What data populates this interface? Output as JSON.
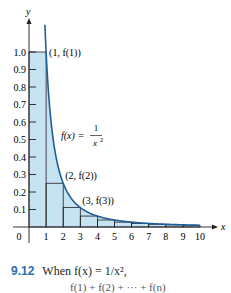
{
  "figure": {
    "caption_number": "9.12",
    "caption_text": "When f(x) = 1/x²,",
    "partial_next_line": "f(1) + f(2) + ··· + f(n)"
  },
  "colors": {
    "fill": "#c6e3f2",
    "curve": "#1f5f99",
    "axis": "#231f20",
    "caption_number": "#2a6fb0"
  },
  "chart_data": {
    "type": "line",
    "title": "",
    "function_label": "f(x) = 1/x²",
    "xlabel": "x",
    "ylabel": "y",
    "x_ticks": [
      "0",
      "1",
      "2",
      "3",
      "4",
      "5",
      "6",
      "7",
      "8",
      "9",
      "10"
    ],
    "y_ticks": [
      "0.1",
      "0.2",
      "0.3",
      "0.4",
      "0.5",
      "0.6",
      "0.7",
      "0.8",
      "0.9",
      "1.0"
    ],
    "xlim": [
      0,
      10
    ],
    "ylim": [
      0,
      1.0
    ],
    "grid": false,
    "curve": {
      "x": [
        1,
        2,
        3,
        4,
        5,
        6,
        7,
        8,
        9,
        10
      ],
      "y": [
        1.0,
        0.25,
        0.1111,
        0.0625,
        0.04,
        0.0278,
        0.0204,
        0.0156,
        0.0123,
        0.01
      ]
    },
    "rectangles": [
      {
        "x0": 0,
        "x1": 1,
        "height": 1.0
      },
      {
        "x0": 1,
        "x1": 2,
        "height": 0.25
      },
      {
        "x0": 2,
        "x1": 3,
        "height": 0.1111
      },
      {
        "x0": 3,
        "x1": 4,
        "height": 0.0625
      },
      {
        "x0": 4,
        "x1": 5,
        "height": 0.04
      },
      {
        "x0": 5,
        "x1": 6,
        "height": 0.0278
      },
      {
        "x0": 6,
        "x1": 7,
        "height": 0.0204
      },
      {
        "x0": 7,
        "x1": 8,
        "height": 0.0156
      },
      {
        "x0": 8,
        "x1": 9,
        "height": 0.0123
      },
      {
        "x0": 9,
        "x1": 10,
        "height": 0.01
      }
    ],
    "annotations": [
      "(1, f(1))",
      "(2, f(2))",
      "(3, f(3))"
    ]
  }
}
